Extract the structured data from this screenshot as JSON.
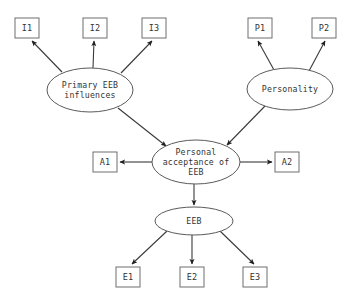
{
  "diagram": {
    "type": "path-diagram",
    "background_color": "#ffffff",
    "box_stroke_color": "#6e6e6e",
    "ellipse_stroke_color": "#5a5a5a",
    "edge_color": "#3a3a3a",
    "text_color": "#333333",
    "latent_variables": [
      {
        "id": "primary-eeb-influences",
        "shape": "ellipse",
        "lines": [
          "Primary EEB",
          "influences"
        ],
        "cx": 90,
        "cy": 90,
        "rx": 43,
        "ry": 22
      },
      {
        "id": "personality",
        "shape": "ellipse",
        "lines": [
          "Personality"
        ],
        "cx": 290,
        "cy": 89,
        "rx": 43,
        "ry": 21
      },
      {
        "id": "personal-acceptance-of-eeb",
        "shape": "ellipse",
        "lines": [
          "Personal",
          "acceptance of",
          "EEB"
        ],
        "cx": 196,
        "cy": 162,
        "rx": 44,
        "ry": 22
      },
      {
        "id": "eeb",
        "shape": "ellipse",
        "lines": [
          "EEB"
        ],
        "cx": 194,
        "cy": 221,
        "rx": 39,
        "ry": 14
      }
    ],
    "observed_variables": [
      {
        "id": "i1",
        "label": "I1",
        "x": 15,
        "y": 18,
        "w": 24,
        "h": 20
      },
      {
        "id": "i2",
        "label": "I2",
        "x": 83,
        "y": 18,
        "w": 24,
        "h": 20
      },
      {
        "id": "i3",
        "label": "I3",
        "x": 142,
        "y": 18,
        "w": 24,
        "h": 20
      },
      {
        "id": "p1",
        "label": "P1",
        "x": 248,
        "y": 18,
        "w": 24,
        "h": 20
      },
      {
        "id": "p2",
        "label": "P2",
        "x": 312,
        "y": 18,
        "w": 24,
        "h": 20
      },
      {
        "id": "a1",
        "label": "A1",
        "x": 93,
        "y": 152,
        "w": 24,
        "h": 20
      },
      {
        "id": "a2",
        "label": "A2",
        "x": 275,
        "y": 152,
        "w": 24,
        "h": 20
      },
      {
        "id": "e1",
        "label": "E1",
        "x": 116,
        "y": 267,
        "w": 24,
        "h": 20
      },
      {
        "id": "e2",
        "label": "E2",
        "x": 180,
        "y": 267,
        "w": 24,
        "h": 20
      },
      {
        "id": "e3",
        "label": "E3",
        "x": 243,
        "y": 267,
        "w": 24,
        "h": 20
      }
    ],
    "edges": [
      {
        "id": "edge-primary-to-i1",
        "from": "primary-eeb-influences",
        "to": "i1",
        "from_x": 62,
        "from_y": 72,
        "to_x": 32,
        "to_y": 41
      },
      {
        "id": "edge-primary-to-i2",
        "from": "primary-eeb-influences",
        "to": "i2",
        "from_x": 93,
        "from_y": 68,
        "to_x": 94,
        "to_y": 41
      },
      {
        "id": "edge-primary-to-i3",
        "from": "primary-eeb-influences",
        "to": "i3",
        "from_x": 121,
        "from_y": 73,
        "to_x": 152,
        "to_y": 41
      },
      {
        "id": "edge-personality-to-p1",
        "from": "personality",
        "to": "p1",
        "from_x": 274,
        "from_y": 70,
        "to_x": 258,
        "to_y": 41
      },
      {
        "id": "edge-personality-to-p2",
        "from": "personality",
        "to": "p2",
        "from_x": 309,
        "from_y": 71,
        "to_x": 325,
        "to_y": 41
      },
      {
        "id": "edge-primary-to-acceptance",
        "from": "primary-eeb-influences",
        "to": "personal-acceptance-of-eeb",
        "from_x": 118,
        "from_y": 108,
        "to_x": 166,
        "to_y": 146
      },
      {
        "id": "edge-personality-to-acceptance",
        "from": "personality",
        "to": "personal-acceptance-of-eeb",
        "from_x": 265,
        "from_y": 106,
        "to_x": 227,
        "to_y": 145
      },
      {
        "id": "edge-acceptance-to-a1",
        "from": "personal-acceptance-of-eeb",
        "to": "a1",
        "from_x": 152,
        "from_y": 162,
        "to_x": 120,
        "to_y": 162
      },
      {
        "id": "edge-acceptance-to-a2",
        "from": "personal-acceptance-of-eeb",
        "to": "a2",
        "from_x": 240,
        "from_y": 162,
        "to_x": 272,
        "to_y": 162
      },
      {
        "id": "edge-acceptance-to-eeb",
        "from": "personal-acceptance-of-eeb",
        "to": "eeb",
        "from_x": 194,
        "from_y": 184,
        "to_x": 194,
        "to_y": 205
      },
      {
        "id": "edge-eeb-to-e1",
        "from": "eeb",
        "to": "e1",
        "from_x": 167,
        "from_y": 231,
        "to_x": 132,
        "to_y": 264
      },
      {
        "id": "edge-eeb-to-e2",
        "from": "eeb",
        "to": "e2",
        "from_x": 192,
        "from_y": 235,
        "to_x": 192,
        "to_y": 264
      },
      {
        "id": "edge-eeb-to-e3",
        "from": "eeb",
        "to": "e3",
        "from_x": 220,
        "from_y": 231,
        "to_x": 254,
        "to_y": 264
      }
    ]
  }
}
